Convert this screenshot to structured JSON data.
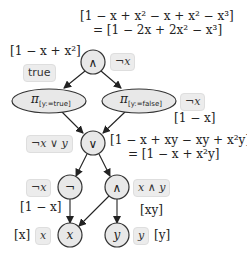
{
  "diagram": {
    "nodes": [
      {
        "id": "and-top",
        "label": "∧",
        "annotation": "¬x"
      },
      {
        "id": "proj-true",
        "label": "π",
        "subscript": "[y:=true]"
      },
      {
        "id": "proj-false",
        "label": "π",
        "subscript": "[y:=false]",
        "annotation": "¬x"
      },
      {
        "id": "or",
        "label": "∨",
        "annotation": "¬x ∨ y"
      },
      {
        "id": "not",
        "label": "¬",
        "annotation": "¬x"
      },
      {
        "id": "and-low",
        "label": "∧",
        "annotation": "x ∧ y"
      },
      {
        "id": "x",
        "label": "x",
        "annotation": "x"
      },
      {
        "id": "y",
        "label": "y",
        "annotation": "y"
      }
    ],
    "edges": [
      [
        "and-top",
        "proj-true"
      ],
      [
        "and-top",
        "proj-false"
      ],
      [
        "proj-true",
        "or"
      ],
      [
        "proj-false",
        "or"
      ],
      [
        "or",
        "not"
      ],
      [
        "or",
        "and-low"
      ],
      [
        "not",
        "x"
      ],
      [
        "and-low",
        "x"
      ],
      [
        "and-low",
        "y"
      ]
    ]
  },
  "labels": {
    "top_poly_line1": "[1 − x + x² − x + x² − x³]",
    "top_poly_line2": "= [1 − 2x + 2x² − x³]",
    "top_left_poly": "[1 − x + x²]",
    "true_tag": "true",
    "and_top_tag": "¬x",
    "proj_false_tag": "¬x",
    "proj_false_poly": "[1 − x]",
    "or_tag": "¬x ∨ y",
    "or_poly_line1": "[1 − x + xy − xy + x²y]",
    "or_poly_line2": "= [1 − x + x²y]",
    "not_tag": "¬x",
    "not_poly": "[1 − x]",
    "and_low_tag": "x ∧ y",
    "and_low_poly": "[xy]",
    "x_poly": "[x]",
    "x_tag": "x",
    "y_tag": "y",
    "y_poly": "[y]"
  },
  "node_text": {
    "and_top": "∧",
    "proj_true_pi": "π",
    "proj_true_sub": "[y:=true]",
    "proj_false_pi": "π",
    "proj_false_sub": "[y:=false]",
    "or": "∨",
    "not": "¬",
    "and_low": "∧",
    "x": "x",
    "y": "y"
  },
  "colors": {
    "node_fill": "#e8e8e8",
    "node_stroke": "#333333",
    "tag_bg": "#ececec"
  }
}
